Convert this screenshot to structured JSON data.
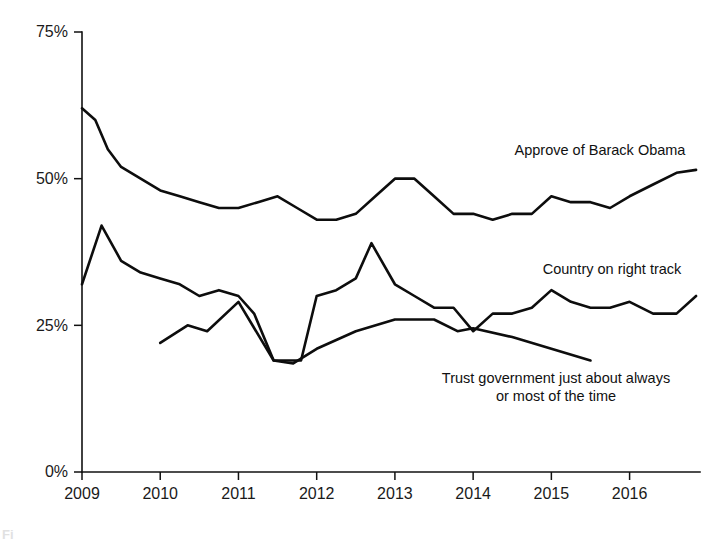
{
  "chart_data": {
    "type": "line",
    "title": "",
    "subtitle": "",
    "xlabel": "",
    "ylabel": "",
    "xlim": [
      2009.0,
      2016.9
    ],
    "ylim": [
      0,
      75
    ],
    "grid": false,
    "legend_position": "inline-annotations",
    "y_ticks": [
      0,
      25,
      50,
      75
    ],
    "y_tick_labels": [
      "0%",
      "25%",
      "50%",
      "75%"
    ],
    "x_ticks": [
      2009,
      2010,
      2011,
      2012,
      2013,
      2014,
      2015,
      2016
    ],
    "x_tick_labels": [
      "2009",
      "2010",
      "2011",
      "2012",
      "2013",
      "2014",
      "2015",
      "2016"
    ],
    "series": [
      {
        "name": "Approve of Barack Obama",
        "color": "#0d0d0d",
        "x": [
          2009.0,
          2009.17,
          2009.33,
          2009.5,
          2009.75,
          2010.0,
          2010.25,
          2010.5,
          2010.75,
          2011.0,
          2011.25,
          2011.5,
          2011.75,
          2012.0,
          2012.25,
          2012.5,
          2012.75,
          2013.0,
          2013.25,
          2013.5,
          2013.75,
          2014.0,
          2014.25,
          2014.5,
          2014.75,
          2015.0,
          2015.25,
          2015.5,
          2015.75,
          2016.0,
          2016.3,
          2016.6,
          2016.85
        ],
        "values": [
          62,
          60,
          55,
          52,
          50,
          48,
          47,
          46,
          45,
          45,
          46,
          47,
          45,
          43,
          43,
          44,
          47,
          50,
          50,
          47,
          44,
          44,
          43,
          44,
          44,
          47,
          46,
          46,
          45,
          47,
          49,
          51,
          51.5
        ]
      },
      {
        "name": "Country on right track",
        "color": "#0d0d0d",
        "x": [
          2009.0,
          2009.25,
          2009.5,
          2009.75,
          2010.0,
          2010.25,
          2010.5,
          2010.75,
          2011.0,
          2011.2,
          2011.45,
          2011.6,
          2011.8,
          2012.0,
          2012.25,
          2012.5,
          2012.7,
          2013.0,
          2013.25,
          2013.5,
          2013.75,
          2014.0,
          2014.25,
          2014.5,
          2014.75,
          2015.0,
          2015.25,
          2015.5,
          2015.75,
          2016.0,
          2016.3,
          2016.6,
          2016.85
        ],
        "values": [
          32,
          42,
          36,
          34,
          33,
          32,
          30,
          31,
          30,
          27,
          19,
          19,
          19,
          30,
          31,
          33,
          39,
          32,
          30,
          28,
          28,
          24,
          27,
          27,
          28,
          31,
          29,
          28,
          28,
          29,
          27,
          27,
          30
        ]
      },
      {
        "name": "Trust government just about always or most of the time",
        "color": "#0d0d0d",
        "x": [
          2010.0,
          2010.35,
          2010.6,
          2011.0,
          2011.45,
          2011.7,
          2012.0,
          2012.5,
          2013.0,
          2013.5,
          2013.8,
          2014.0,
          2014.5,
          2015.0,
          2015.5
        ],
        "values": [
          22,
          25,
          24,
          29,
          19,
          18.5,
          21,
          24,
          26,
          26,
          24,
          24.5,
          23,
          21,
          19
        ]
      }
    ],
    "annotations": [
      {
        "name": "approve-of-barack-obama",
        "lines": [
          "Approve of Barack Obama"
        ],
        "x_px": 600,
        "y_px": 155,
        "anchor": "middle"
      },
      {
        "name": "country-on-right-track",
        "lines": [
          "Country on right track"
        ],
        "x_px": 612,
        "y_px": 274,
        "anchor": "middle"
      },
      {
        "name": "trust-government",
        "lines": [
          "Trust government just about always",
          "or most of the time"
        ],
        "x_px": 556,
        "y_px": 383,
        "anchor": "middle"
      }
    ]
  },
  "caption": {
    "partial_text": "Fi"
  }
}
